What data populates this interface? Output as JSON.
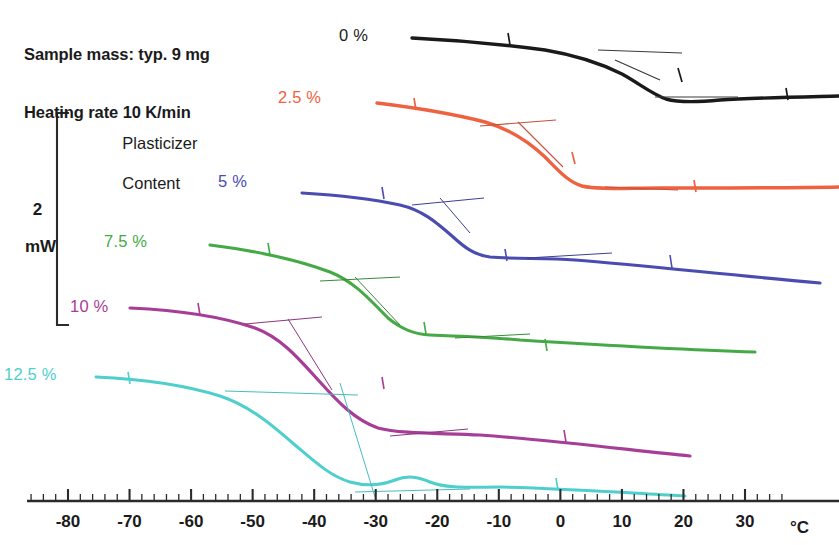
{
  "figure": {
    "notes": [
      "Sample mass: typ. 9 mg",
      "Heating rate 10 K/min"
    ],
    "scale_bar": {
      "value": "2",
      "unit": "mW"
    },
    "legend_title_lines": [
      "Plasticizer",
      "Content"
    ],
    "axis_unit_label": "°C"
  },
  "chart_data": {
    "type": "line",
    "subtitle": "Sample mass: typ. 9 mg / Heating rate 10 K/min",
    "xlabel": "°C",
    "ylabel": "Heat flow (offset curves, 2 mW scale bar)",
    "xlim": [
      -86,
      36
    ],
    "ylim_note": "Arbitrary offset heat-flow axis; only a 2 mW scale bar is given",
    "grid": false,
    "legend_position": "inline-left-of-each-curve",
    "x_ticks_major": [
      -80,
      -70,
      -60,
      -50,
      -40,
      -30,
      -20,
      -10,
      0,
      10,
      20,
      30
    ],
    "x_tick_labels": [
      "-80",
      "-70",
      "-60",
      "-50",
      "-40",
      "-30",
      "-20",
      "-10",
      "0",
      "10",
      "20",
      "30"
    ],
    "x_minor_tick_step": 2,
    "series": [
      {
        "name": "0 %",
        "label": "0 %",
        "color": "#1a1a1a",
        "glass_transition_midpoint_C": 17,
        "x": [
          -24,
          -18,
          -12,
          -6,
          0,
          4,
          8,
          12,
          16,
          19,
          22,
          25,
          28,
          31,
          34
        ],
        "y_px": [
          38,
          40,
          42,
          45,
          49,
          53,
          58,
          66,
          77,
          86,
          95,
          100,
          101,
          99,
          98
        ]
      },
      {
        "name": "2.5 %",
        "label": "2.5 %",
        "color": "#ef613f",
        "glass_transition_midpoint_C": -7,
        "x": [
          -57,
          -50,
          -44,
          -38,
          -32,
          -27,
          -22,
          -17,
          -13,
          -10,
          -7,
          -4,
          0,
          6,
          14,
          22,
          30,
          34
        ],
        "y_px": [
          103,
          107,
          111,
          116,
          123,
          131,
          141,
          154,
          165,
          175,
          183,
          187,
          188,
          188,
          187,
          187,
          187,
          187
        ]
      },
      {
        "name": "5 %",
        "label": "5 %",
        "color": "#4a4cb0",
        "glass_transition_midpoint_C": -19,
        "x": [
          -68,
          -62,
          -56,
          -50,
          -45,
          -40,
          -35,
          -31,
          -27,
          -24,
          -21,
          -18,
          -14,
          -8,
          0,
          8,
          16,
          24,
          32,
          34
        ],
        "y_px": [
          193,
          195,
          197,
          200,
          204,
          211,
          220,
          230,
          241,
          249,
          254,
          256,
          257,
          258,
          260,
          264,
          269,
          274,
          281,
          283
        ]
      },
      {
        "name": "7.5 %",
        "label": "7.5 %",
        "color": "#45a945",
        "glass_transition_midpoint_C": -30,
        "x": [
          -83,
          -77,
          -71,
          -65,
          -60,
          -55,
          -50,
          -45,
          -41,
          -37,
          -34,
          -31,
          -28,
          -22,
          -14,
          -6,
          2,
          8,
          12
        ],
        "y_px": [
          245,
          249,
          253,
          258,
          264,
          272,
          281,
          292,
          302,
          313,
          322,
          328,
          331,
          333,
          336,
          340,
          345,
          348,
          350
        ]
      },
      {
        "name": "10 %",
        "label": "10 %",
        "color": "#a63d97",
        "glass_transition_midpoint_C": -41,
        "x": [
          -97,
          -92,
          -87,
          -82,
          -77,
          -72,
          -67,
          -62,
          -57,
          -52,
          -48,
          -44,
          -41,
          -38,
          -34,
          -28,
          -20,
          -12,
          -4,
          2
        ],
        "y_px": [
          308,
          309,
          311,
          314,
          319,
          327,
          338,
          351,
          366,
          382,
          396,
          410,
          422,
          429,
          432,
          434,
          438,
          443,
          449,
          455
        ]
      },
      {
        "name": "12.5 %",
        "label": "12.5 %",
        "color": "#4ecfcd",
        "glass_transition_midpoint_C": -50,
        "x": [
          -101,
          -96,
          -90,
          -85,
          -80,
          -75,
          -70,
          -65,
          -60,
          -56,
          -52,
          -48,
          -45,
          -42,
          -38,
          -34,
          -30,
          -24,
          -16,
          -8,
          0,
          2
        ],
        "y_px": [
          377,
          378,
          380,
          382,
          385,
          390,
          397,
          406,
          417,
          428,
          440,
          452,
          463,
          472,
          479,
          484,
          486,
          485,
          484,
          486,
          492,
          495
        ]
      }
    ],
    "annotations": [
      {
        "kind": "tangent-construction",
        "series": "0 %",
        "note": "inflection tangent + baseline extensions drawn as thin straight lines"
      },
      {
        "kind": "tangent-construction",
        "series": "2.5 %",
        "note": "inflection tangent + baseline extensions drawn as thin straight lines"
      },
      {
        "kind": "tangent-construction",
        "series": "5 %",
        "note": "inflection tangent + baseline extensions drawn as thin straight lines"
      },
      {
        "kind": "tangent-construction",
        "series": "7.5 %",
        "note": "inflection tangent + baseline extensions drawn as thin straight lines"
      },
      {
        "kind": "tangent-construction",
        "series": "10 %",
        "note": "inflection tangent + baseline extensions drawn as thin straight lines"
      },
      {
        "kind": "tangent-construction",
        "series": "12.5 %",
        "note": "inflection tangent + baseline extensions drawn as thin straight lines"
      }
    ]
  },
  "labels": {
    "s0": "0 %",
    "s1": "2.5 %",
    "s2": "5 %",
    "s3": "7.5 %",
    "s4": "10 %",
    "s5": "12.5 %",
    "legend_l1": "Plasticizer",
    "legend_l2": "Content",
    "note1": "Sample mass: typ. 9 mg",
    "note2": "Heating rate 10 K/min",
    "scale_value": "2",
    "scale_unit": "mW",
    "unit": "°C",
    "t_m80": "-80",
    "t_m70": "-70",
    "t_m60": "-60",
    "t_m50": "-50",
    "t_m40": "-40",
    "t_m30": "-30",
    "t_m20": "-20",
    "t_m10": "-10",
    "t_0": "0",
    "t_10": "10",
    "t_20": "20",
    "t_30": "30"
  },
  "colors": {
    "s0": "#1a1a1a",
    "s1": "#ef613f",
    "s2": "#4a4cb0",
    "s3": "#45a945",
    "s4": "#a63d97",
    "s5": "#4ecfcd",
    "axis": "#2b2b2b",
    "text": "#1b1b1b"
  }
}
